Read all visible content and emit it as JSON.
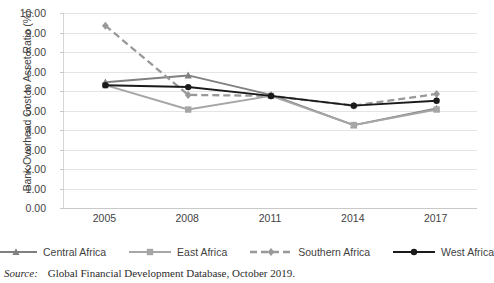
{
  "chart_data": {
    "type": "line",
    "title": "",
    "xlabel": "",
    "ylabel": "Bank Overhead Cost to Asset Ratio (%)",
    "categories": [
      "2005",
      "2008",
      "2011",
      "2014",
      "2017"
    ],
    "ylim": [
      0.0,
      10.0
    ],
    "ytick_step": 1.0,
    "ytick_labels": [
      "0.00",
      "1.00",
      "2.00",
      "3.00",
      "4.00",
      "5.00",
      "6.00",
      "7.00",
      "8.00",
      "9.00",
      "10.00"
    ],
    "grid": "horizontal",
    "legend_position": "bottom",
    "series": [
      {
        "name": "Central Africa",
        "values": [
          6.45,
          6.8,
          5.8,
          4.25,
          5.1
        ],
        "color": "#808080",
        "marker": "triangle",
        "dash": "solid"
      },
      {
        "name": "East Africa",
        "values": [
          6.3,
          5.05,
          5.75,
          4.25,
          5.05
        ],
        "color": "#a6a6a6",
        "marker": "square",
        "dash": "solid"
      },
      {
        "name": "Southern Africa",
        "values": [
          9.35,
          5.8,
          5.75,
          5.25,
          5.85
        ],
        "color": "#999999",
        "marker": "diamond",
        "dash": "dashed"
      },
      {
        "name": "West Africa",
        "values": [
          6.3,
          6.2,
          5.75,
          5.25,
          5.5
        ],
        "color": "#1a1a1a",
        "marker": "circle",
        "dash": "solid"
      }
    ]
  },
  "source": {
    "label": "Source:",
    "text": "Global Financial Development Database, October 2019."
  }
}
